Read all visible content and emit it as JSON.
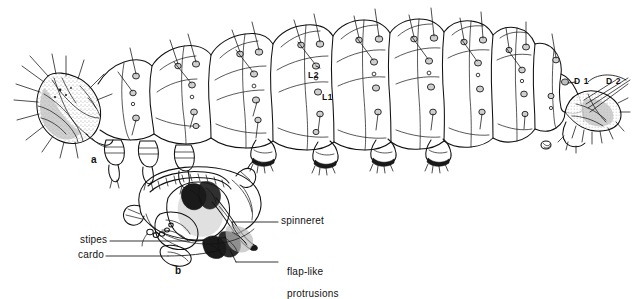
{
  "figure": {
    "type": "scientific-illustration",
    "background_color": "#ffffff",
    "ink_color": "#111111",
    "panels": [
      {
        "id": "a",
        "label": "a",
        "caption": "larva, lateral view"
      },
      {
        "id": "b",
        "label": "b",
        "caption": "head and mouthparts, ventral view"
      }
    ]
  },
  "panel_a": {
    "label": "a",
    "setae_labels": [
      {
        "name": "L2",
        "text": "L2"
      },
      {
        "name": "L1",
        "text": "L1"
      },
      {
        "name": "D1",
        "text": "D 1"
      },
      {
        "name": "D2",
        "text": "D 2"
      }
    ]
  },
  "panel_b": {
    "label": "b",
    "callouts": [
      {
        "name": "spinneret",
        "text": "spinneret"
      },
      {
        "name": "stipes",
        "text": "stipes"
      },
      {
        "name": "cardo",
        "text": "cardo"
      },
      {
        "name": "flap-like-protrusions",
        "line1": "flap-like",
        "line2": "protrusions"
      }
    ]
  }
}
